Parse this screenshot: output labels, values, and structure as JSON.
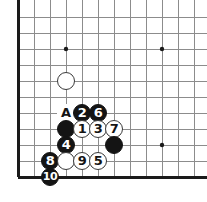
{
  "diagram": {
    "kind": "go-board-diagram",
    "board": {
      "cols": 12,
      "rows": 11,
      "origin_x": 18,
      "origin_y": 17,
      "spacing": 16,
      "line_color": "#8c8c8c",
      "edge_color": "#1a1a1a",
      "edge_width": 3,
      "line_width": 1,
      "background": "#ffffff",
      "edges": [
        "left",
        "bottom"
      ],
      "star_points": [
        {
          "col": 3,
          "row": 2
        },
        {
          "col": 9,
          "row": 2
        },
        {
          "col": 9,
          "row": 8
        }
      ],
      "star_radius": 2.2
    },
    "stone_radius": 9.2,
    "stones": [
      {
        "id": "w-unnumbered-upper",
        "col": 3,
        "row": 4,
        "color": "white",
        "label": ""
      },
      {
        "id": "move-2",
        "col": 4,
        "row": 6,
        "color": "black",
        "label": "2"
      },
      {
        "id": "move-6",
        "col": 5,
        "row": 6,
        "color": "black",
        "label": "6"
      },
      {
        "id": "b-unnumbered-left",
        "col": 3,
        "row": 7,
        "color": "black",
        "label": ""
      },
      {
        "id": "move-1",
        "col": 4,
        "row": 7,
        "color": "white",
        "label": "1"
      },
      {
        "id": "move-3",
        "col": 5,
        "row": 7,
        "color": "white",
        "label": "3"
      },
      {
        "id": "move-7",
        "col": 6,
        "row": 7,
        "color": "white",
        "label": "7"
      },
      {
        "id": "move-4",
        "col": 3,
        "row": 8,
        "color": "black",
        "label": "4"
      },
      {
        "id": "b-unnumbered-right",
        "col": 6,
        "row": 8,
        "color": "black",
        "label": ""
      },
      {
        "id": "move-8",
        "col": 2,
        "row": 9,
        "color": "black",
        "label": "8"
      },
      {
        "id": "w-unnumbered-lower",
        "col": 3,
        "row": 9,
        "color": "white",
        "label": ""
      },
      {
        "id": "move-9",
        "col": 4,
        "row": 9,
        "color": "white",
        "label": "9"
      },
      {
        "id": "move-5",
        "col": 5,
        "row": 9,
        "color": "white",
        "label": "5"
      },
      {
        "id": "move-10",
        "col": 2,
        "row": 10,
        "color": "black",
        "label": "10"
      }
    ],
    "point_labels": [
      {
        "id": "label-a",
        "col": 3,
        "row": 6,
        "text": "A"
      }
    ]
  }
}
